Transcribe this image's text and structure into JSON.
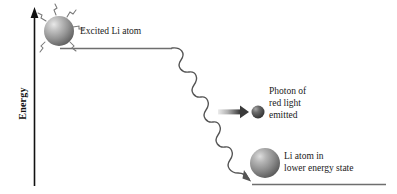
{
  "figure": {
    "type": "energy-level-emission-diagram",
    "background_color": "#ffffff",
    "axis": {
      "label": "Energy",
      "orientation": "vertical",
      "arrow_direction": "up",
      "color": "#111111"
    },
    "energy_levels": [
      {
        "name": "upper-energy-level",
        "label": "",
        "x_start": 60,
        "x_end": 172,
        "y": 48,
        "color": "#6e6e6e"
      },
      {
        "name": "lower-energy-level",
        "label": "",
        "x_start": 252,
        "x_end": 386,
        "y": 184,
        "color": "#6e6e6e"
      }
    ],
    "labels": {
      "excited_atom": "Excited Li atom",
      "photon": "Photon of\nred light\nemitted",
      "lower_state_atom": "Li atom in\nlower energy state"
    },
    "objects": {
      "excited_atom": {
        "name": "excited-lithium-atom",
        "cx": 59,
        "cy": 31,
        "r": 15,
        "fill": "#9a9a9a",
        "highlight": "#d8d8d8",
        "emission_squiggle_count": 6
      },
      "photon": {
        "name": "emitted-photon",
        "cx": 258,
        "cy": 112,
        "r": 6.5,
        "fill": "#4a4a4a",
        "highlight": "#9a9a9a"
      },
      "lower_atom": {
        "name": "lower-state-lithium-atom",
        "cx": 265,
        "cy": 163,
        "r": 15,
        "fill": "#8e8e8e",
        "highlight": "#d0d0d0"
      },
      "photon_arrow": {
        "name": "photon-emission-arrow",
        "x_start": 218,
        "x_end": 248,
        "y": 112,
        "gradient_from": "#e2e2e2",
        "gradient_to": "#3c3c3c"
      },
      "wave": {
        "name": "photon-wave-path",
        "x_start": 172,
        "y_start": 48,
        "x_end": 250,
        "y_end": 180,
        "color": "#555555",
        "arrowhead": true
      }
    }
  }
}
